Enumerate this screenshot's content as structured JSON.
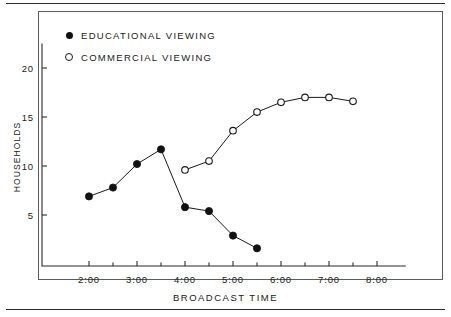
{
  "figure": {
    "width": 451,
    "height": 317,
    "background_color": "#ffffff",
    "ink_color": "#1a1a1a",
    "frame_color": "#5a5a63"
  },
  "chart_data": {
    "type": "line",
    "title": "",
    "xlabel": "BROADCAST TIME",
    "ylabel": "HOUSEHOLDS",
    "xlim": [
      1.6,
      8.6
    ],
    "ylim": [
      0,
      22.5
    ],
    "grid": false,
    "legend_position": "top-left",
    "x_tick_labels": [
      "2:00",
      "3:00",
      "4:00",
      "5:00",
      "6:00",
      "7:00",
      "8:00"
    ],
    "x_tick_values": [
      2,
      3,
      4,
      5,
      6,
      7,
      8
    ],
    "x_minor_tick_values": [
      2.5,
      3.5,
      4.5,
      5.5,
      6.5,
      7.5
    ],
    "y_tick_labels": [
      "5",
      "10",
      "15",
      "20"
    ],
    "y_tick_values": [
      5,
      10,
      15,
      20
    ],
    "series": [
      {
        "name": "EDUCATIONAL VIEWING",
        "marker": "filled-circle",
        "color": "#111111",
        "x": [
          2.0,
          2.5,
          3.0,
          3.5,
          4.0,
          4.5,
          5.0,
          5.5
        ],
        "values": [
          6.9,
          7.8,
          10.2,
          11.7,
          5.8,
          5.4,
          2.9,
          1.6
        ]
      },
      {
        "name": "COMMERCIAL VIEWING",
        "marker": "open-circle",
        "color": "#1a1a1a",
        "x": [
          4.0,
          4.5,
          5.0,
          5.5,
          6.0,
          6.5,
          7.0,
          7.5
        ],
        "values": [
          9.6,
          10.5,
          13.6,
          15.5,
          16.5,
          17.0,
          17.0,
          16.6
        ]
      }
    ]
  },
  "legend": {
    "items": [
      {
        "label": "EDUCATIONAL VIEWING",
        "marker": "filled-circle"
      },
      {
        "label": "COMMERCIAL VIEWING",
        "marker": "open-circle"
      }
    ]
  }
}
